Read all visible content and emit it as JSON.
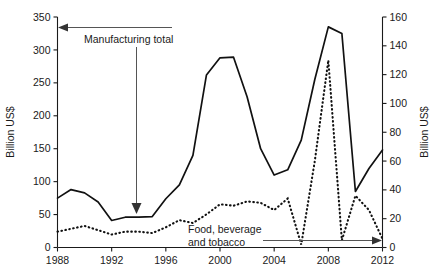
{
  "chart_data": {
    "type": "line",
    "title": "",
    "xlabel": "",
    "ylabel": "Billion US$",
    "y2label": "Billion US$",
    "xlim": [
      1988,
      2012
    ],
    "ylim": [
      0,
      350
    ],
    "y2lim": [
      0,
      160
    ],
    "xticks": [
      1988,
      1992,
      1996,
      2000,
      2004,
      2008,
      2012
    ],
    "yticks": [
      0,
      50,
      100,
      150,
      200,
      250,
      300,
      350
    ],
    "y2ticks": [
      0,
      20,
      40,
      60,
      80,
      100,
      120,
      140,
      160
    ],
    "grid": false,
    "legend_position": "inline-annotations",
    "x": [
      1988,
      1989,
      1990,
      1991,
      1992,
      1993,
      1994,
      1995,
      1996,
      1997,
      1998,
      1999,
      2000,
      2001,
      2002,
      2003,
      2004,
      2005,
      2006,
      2007,
      2008,
      2009,
      2010,
      2011,
      2012
    ],
    "series": [
      {
        "name": "Manufacturing total",
        "axis": "left",
        "style": "solid",
        "values": [
          75,
          88,
          83,
          69,
          41,
          46,
          46,
          47,
          74,
          95,
          140,
          262,
          288,
          289,
          229,
          150,
          110,
          118,
          163,
          255,
          335,
          325,
          85,
          120,
          148
        ]
      },
      {
        "name": "Food, beverage and tobacco",
        "axis": "right",
        "style": "dotted",
        "values": [
          11,
          13,
          15,
          12,
          9,
          11,
          11,
          10,
          14,
          19,
          17,
          23,
          30,
          29,
          32,
          31,
          26,
          34,
          2,
          60,
          130,
          5,
          36,
          26,
          6
        ]
      }
    ],
    "annotations": [
      {
        "name": "manufacturing-total",
        "text": "Manufacturing total",
        "arrows": [
          "left-to-y-axis",
          "down-to-solid-line"
        ]
      },
      {
        "name": "food-beverage-tobacco",
        "text_line1": "Food, beverage",
        "text_line2": "and tobacco",
        "arrows": [
          "right-to-y2-axis"
        ]
      }
    ]
  },
  "axes": {
    "left_title": "Billion US$",
    "right_title": "Billion US$",
    "y_tick_labels": [
      "350",
      "300",
      "250",
      "200",
      "150",
      "100",
      "50",
      "0"
    ],
    "y2_tick_labels": [
      "160",
      "140",
      "120",
      "100",
      "80",
      "60",
      "40",
      "20",
      "0"
    ],
    "x_tick_labels": [
      "1988",
      "1992",
      "1996",
      "2000",
      "2004",
      "2008",
      "2012"
    ]
  },
  "annotations": {
    "manufacturing_label": "Manufacturing total",
    "food_label_line1": "Food, beverage",
    "food_label_line2": "and tobacco"
  },
  "colors": {
    "ink": "#111111",
    "annotation": "#555555",
    "background": "#ffffff"
  }
}
